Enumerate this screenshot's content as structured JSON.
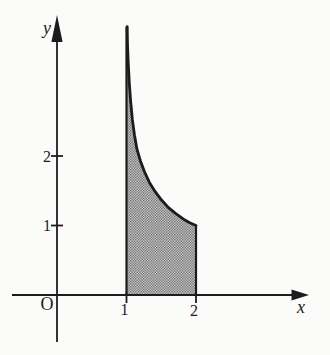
{
  "chart_data": {
    "type": "area",
    "title": "",
    "xlabel": "x",
    "ylabel": "y",
    "origin_label": "O",
    "x_ticks": [
      "1",
      "2"
    ],
    "y_ticks": [
      "1",
      "2"
    ],
    "xlim": [
      -0.65,
      3.45
    ],
    "ylim": [
      -0.68,
      4.0
    ],
    "grid": false,
    "curve": {
      "description": "decreasing convex curve with vertical asymptote at x=1, passing through (2,1); consistent with y = 1/sqrt(x-1)",
      "points": [
        [
          1.01,
          3.86
        ],
        [
          1.015,
          3.6
        ],
        [
          1.025,
          3.35
        ],
        [
          1.04,
          3.05
        ],
        [
          1.06,
          2.78
        ],
        [
          1.085,
          2.52
        ],
        [
          1.115,
          2.3
        ],
        [
          1.15,
          2.1
        ],
        [
          1.2,
          1.93
        ],
        [
          1.26,
          1.77
        ],
        [
          1.33,
          1.62
        ],
        [
          1.41,
          1.49
        ],
        [
          1.5,
          1.37
        ],
        [
          1.6,
          1.26
        ],
        [
          1.71,
          1.17
        ],
        [
          1.82,
          1.09
        ],
        [
          1.91,
          1.04
        ],
        [
          2.0,
          1.0
        ]
      ]
    },
    "shaded_region": {
      "x_from": 1,
      "x_to": 2,
      "bounded_below_by": "x-axis (y=0)",
      "bounded_above_by": "curve",
      "right_edge_height": 1,
      "fill_style": "stipple-halftone"
    },
    "colors": {
      "ink": "#1c1c1c",
      "stipple_dot": "#4a4a4a",
      "stipple_bg": "#e6e6e6",
      "background": "#fbfbfa"
    }
  }
}
